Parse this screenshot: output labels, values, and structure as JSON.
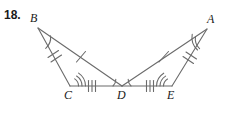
{
  "problem": {
    "number": "18."
  },
  "figure": {
    "type": "geometry-diagram",
    "stroke_color": "#6b6b6b",
    "label_color": "#1a1a1a",
    "background": "#ffffff",
    "vertices": [
      {
        "name": "B",
        "label": "B",
        "x": 38,
        "y": 28
      },
      {
        "name": "A",
        "label": "A",
        "x": 207,
        "y": 29
      },
      {
        "name": "C",
        "label": "C",
        "x": 70,
        "y": 86
      },
      {
        "name": "D",
        "label": "D",
        "x": 122,
        "y": 86
      },
      {
        "name": "E",
        "label": "E",
        "x": 172,
        "y": 86
      }
    ],
    "segments": [
      {
        "name": "BC",
        "from": "B",
        "to": "C",
        "ticks": 2
      },
      {
        "name": "BD",
        "from": "B",
        "to": "D",
        "ticks": 1
      },
      {
        "name": "CD",
        "from": "C",
        "to": "D",
        "ticks": 3
      },
      {
        "name": "DE",
        "from": "D",
        "to": "E",
        "ticks": 3
      },
      {
        "name": "AD",
        "from": "A",
        "to": "D",
        "ticks": 1
      },
      {
        "name": "AE",
        "from": "A",
        "to": "E",
        "ticks": 2
      }
    ],
    "angle_marks": [
      {
        "name": "angle-B",
        "vertex": "B",
        "arcs": 1
      },
      {
        "name": "angle-A",
        "vertex": "A",
        "arcs": 2
      },
      {
        "name": "angle-C",
        "vertex": "C",
        "arcs": 3
      },
      {
        "name": "angle-E",
        "vertex": "E",
        "arcs": 3
      },
      {
        "name": "angle-BDC",
        "vertex": "D",
        "arcs": 1
      },
      {
        "name": "angle-ADE",
        "vertex": "D",
        "arcs": 1
      }
    ]
  }
}
